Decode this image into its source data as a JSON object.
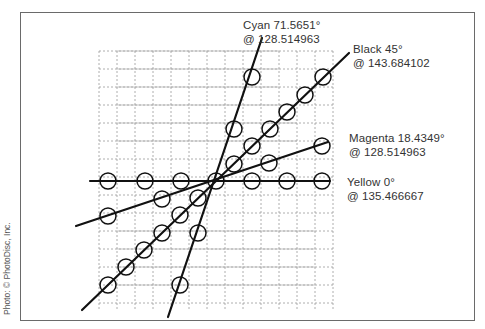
{
  "diagram": {
    "colors": {
      "line": "#111111",
      "grid": "#999999",
      "frame": "#6a6a6a",
      "text": "#333333"
    },
    "screens": [
      {
        "name": "Cyan",
        "angle": "71.5651°",
        "frequency": "@ 128.514963",
        "angle_deg": 71.5651
      },
      {
        "name": "Black",
        "angle": "45°",
        "frequency": "@ 143.684102",
        "angle_deg": 45
      },
      {
        "name": "Magenta",
        "angle": "18.4349°",
        "frequency": "@ 128.514963",
        "angle_deg": 18.4349
      },
      {
        "name": "Yellow",
        "angle": "0°",
        "frequency": "@ 135.466667",
        "angle_deg": 0
      }
    ],
    "grid": {
      "columns": 13,
      "rows": 14,
      "cell_px": 18
    }
  },
  "labels": {
    "cyan_line1": "Cyan  71.5651°",
    "cyan_line2": "@ 128.514963",
    "black_line1": "Black  45°",
    "black_line2": "@ 143.684102",
    "magenta_line1": "Magenta  18.4349°",
    "magenta_line2": "@ 128.514963",
    "yellow_line1": "Yellow  0°",
    "yellow_line2": "@ 135.466667"
  },
  "credit": "Photo: © PhotoDisc, Inc."
}
